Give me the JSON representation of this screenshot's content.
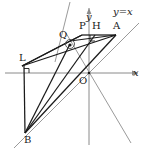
{
  "figure": {
    "colors": {
      "axis": "#8a8a8a",
      "construction": "#9a9a9a",
      "primary": "#1a1a1a",
      "label": "#1a1a1a",
      "background": "#ffffff"
    },
    "axes": {
      "x_label": "x",
      "y_label": "y",
      "origin_label": "O",
      "origin": {
        "x": 89,
        "y": 73
      }
    },
    "lines": [
      {
        "name": "line-y-equals-x",
        "label": "y=x",
        "style": "gray",
        "from": {
          "x": 14,
          "y": 148
        },
        "to": {
          "x": 139,
          "y": 23
        }
      },
      {
        "name": "line-steep-left",
        "style": "gray",
        "from": {
          "x": 69,
          "y": 2
        },
        "to": {
          "x": 57,
          "y": 58
        }
      },
      {
        "name": "line-descending-right",
        "style": "gray",
        "from": {
          "x": 66,
          "y": 34
        },
        "to": {
          "x": 131,
          "y": 143
        }
      }
    ],
    "points": [
      {
        "name": "A",
        "label": "A",
        "x": 116,
        "y": 35,
        "label_dx": -3,
        "label_dy": -14
      },
      {
        "name": "H",
        "label": "H",
        "x": 95,
        "y": 35,
        "label_dx": -3,
        "label_dy": -14
      },
      {
        "name": "P",
        "label": "P",
        "x": 82,
        "y": 35,
        "label_dx": -3,
        "label_dy": -14
      },
      {
        "name": "Q",
        "label": "Q",
        "x": 70,
        "y": 41,
        "label_dx": -11,
        "label_dy": -9
      },
      {
        "name": "L",
        "label": "L",
        "x": 22,
        "y": 66,
        "label_dx": -3,
        "label_dy": -12
      },
      {
        "name": "B",
        "label": "B",
        "x": 25,
        "y": 133,
        "label_dx": -1,
        "label_dy": 3
      },
      {
        "name": "O",
        "label": "O",
        "x": 89,
        "y": 73,
        "label_dx": -10,
        "label_dy": 3
      }
    ],
    "segments": [
      {
        "name": "segment-Q-A",
        "from": "Q",
        "to": "A"
      },
      {
        "name": "segment-Q-P",
        "from": "Q",
        "to": "P"
      },
      {
        "name": "segment-P-H",
        "from": "P",
        "to": "H"
      },
      {
        "name": "segment-H-A",
        "from": "H",
        "to": "A"
      },
      {
        "name": "segment-L-Q",
        "from": "L",
        "to": "Q"
      },
      {
        "name": "segment-L-A",
        "from": "L",
        "to": "A"
      },
      {
        "name": "segment-L-B",
        "from": "L",
        "to": "B"
      },
      {
        "name": "segment-B-A",
        "from": "B",
        "to": "A"
      },
      {
        "name": "segment-B-H",
        "from": "B",
        "to": "H"
      },
      {
        "name": "segment-L-X",
        "from": "L",
        "to": "X"
      }
    ],
    "markers": [
      {
        "name": "right-angle-at-L",
        "x": 22,
        "y": 66
      },
      {
        "name": "right-angle-at-H",
        "x": 95,
        "y": 51
      },
      {
        "name": "circle-marker-at-intersection",
        "x": 70,
        "y": 44
      }
    ]
  }
}
